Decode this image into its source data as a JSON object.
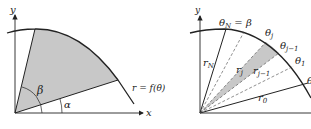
{
  "left_diagram": {
    "axis_x_label": "x",
    "axis_y_label": "y",
    "angle_beta": "β",
    "angle_alpha": "α",
    "curve_label": "r = f(θ)",
    "region_fill": "#c8c8c8"
  },
  "right_diagram": {
    "axis_y_label": "y",
    "top_label": "θ",
    "top_label_sub": "N",
    "top_label_rest": " = β",
    "theta_j": "θ",
    "theta_j_sub": "j",
    "theta_j1": "θ",
    "theta_j1_sub": "j−1",
    "theta_1": "θ",
    "theta_1_sub": "1",
    "theta_0_partial": "θ",
    "r_N": "r",
    "r_N_sub": "N",
    "r_j": "r",
    "r_j_sub": "j",
    "r_j1": "r",
    "r_j1_sub": "j−1",
    "r_0": "r",
    "r_0_sub": "0",
    "wedge_fill": "#c8c8c8"
  }
}
